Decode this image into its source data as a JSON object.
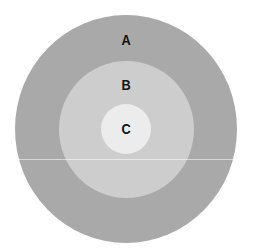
{
  "diagram": {
    "type": "concentric-circles",
    "top_fragment": "",
    "rings": [
      {
        "id": "A",
        "label": "A",
        "color": "#a9a9a9",
        "role": "outer"
      },
      {
        "id": "B",
        "label": "B",
        "color": "#cdcdcd",
        "role": "middle"
      },
      {
        "id": "C",
        "label": "C",
        "color": "#ececec",
        "role": "inner"
      }
    ]
  }
}
